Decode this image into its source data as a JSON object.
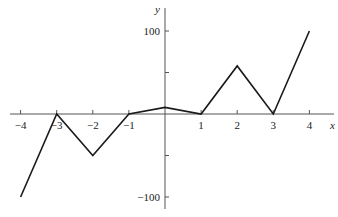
{
  "chart_data": {
    "type": "line",
    "title": "",
    "xlabel": "x",
    "ylabel": "y",
    "x": [
      -4,
      -3,
      -2,
      -1,
      0,
      1,
      2,
      3,
      4
    ],
    "series": [
      {
        "name": "f(x)",
        "values": [
          -100,
          0,
          -50,
          0,
          8,
          0,
          58,
          0,
          100
        ]
      }
    ],
    "x_ticks": [
      -4,
      -3,
      -2,
      -1,
      1,
      2,
      3,
      4
    ],
    "x_tick_labels": [
      "−4",
      "−3",
      "−2",
      "−1",
      "1",
      "2",
      "3",
      "4"
    ],
    "y_ticks": [
      100,
      50,
      -50,
      -100
    ],
    "y_tick_labels": [
      "100",
      "",
      "",
      "−100"
    ],
    "xlim": [
      -4.3,
      4.6
    ],
    "ylim": [
      -115,
      130
    ],
    "grid": false,
    "legend": "none",
    "line_color": "#1a1a1a"
  },
  "layout": {
    "origin_px": [
      165,
      114
    ],
    "px_per_x": 36.1,
    "px_per_y": 0.83,
    "x_axis_span_px": [
      10,
      334
    ],
    "y_axis_span_px": [
      8,
      209
    ]
  }
}
